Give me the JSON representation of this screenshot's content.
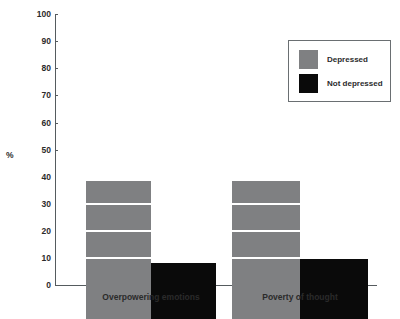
{
  "chart_data": {
    "type": "bar",
    "title": "",
    "xlabel": "",
    "ylabel": "%",
    "ylim": [
      0,
      100
    ],
    "ytick_step": 10,
    "yticks": [
      0,
      10,
      20,
      30,
      40,
      50,
      60,
      70,
      80,
      90,
      100
    ],
    "grid": "horizontal-white-overlay",
    "legend_position": "top-right",
    "categories": [
      "Overpowering emotions",
      "Poverty of thought"
    ],
    "series": [
      {
        "name": "Depressed",
        "color": "#7f8082",
        "values": [
          51,
          51
        ]
      },
      {
        "name": "Not depressed",
        "color": "#0a0a0a",
        "values": [
          20.5,
          22
        ]
      }
    ]
  },
  "axis": {
    "y_title": "%",
    "tick_labels": {
      "t100": "100",
      "t90": "90",
      "t80": "80",
      "t70": "70",
      "t60": "60",
      "t50": "50",
      "t40": "40",
      "t30": "30",
      "t20": "20",
      "t10": "10",
      "t0": "0"
    }
  },
  "categories": {
    "c0": "Overpowering emotions",
    "c1": "Poverty of thought"
  },
  "legend": {
    "items": [
      {
        "label": "Depressed",
        "color": "#7f8082"
      },
      {
        "label": "Not depressed",
        "color": "#0a0a0a"
      }
    ],
    "label0": "Depressed",
    "label1": "Not depressed"
  }
}
